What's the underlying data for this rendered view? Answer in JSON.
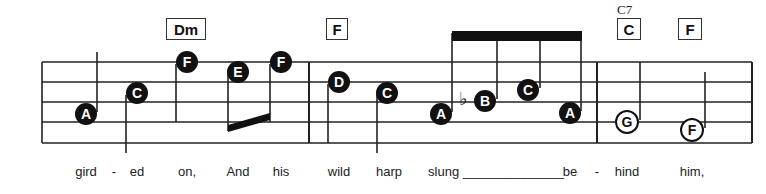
{
  "chords": [
    {
      "label": "Dm",
      "x": 166,
      "w": 38
    },
    {
      "label": "F",
      "x": 326,
      "w": 20
    },
    {
      "label": "C",
      "x": 617,
      "w": 22,
      "sup": "C7"
    },
    {
      "label": "F",
      "x": 678,
      "w": 22
    }
  ],
  "notes": [
    {
      "label": "A",
      "x": 86,
      "y": 114,
      "type": "filled"
    },
    {
      "label": "C",
      "x": 137,
      "y": 93,
      "type": "filled"
    },
    {
      "label": "F",
      "x": 187,
      "y": 62,
      "type": "filled"
    },
    {
      "label": "E",
      "x": 238,
      "y": 72,
      "type": "filled"
    },
    {
      "label": "F",
      "x": 281,
      "y": 62,
      "type": "filled"
    },
    {
      "label": "D",
      "x": 339,
      "y": 82,
      "type": "filled"
    },
    {
      "label": "C",
      "x": 387,
      "y": 93,
      "type": "filled"
    },
    {
      "label": "A",
      "x": 441,
      "y": 114,
      "type": "filled"
    },
    {
      "label": "B",
      "x": 485,
      "y": 101,
      "type": "filled",
      "accidental": "♭"
    },
    {
      "label": "C",
      "x": 528,
      "y": 90,
      "type": "filled"
    },
    {
      "label": "A",
      "x": 570,
      "y": 113,
      "type": "filled"
    },
    {
      "label": "G",
      "x": 627,
      "y": 122,
      "type": "open"
    },
    {
      "label": "F",
      "x": 692,
      "y": 130,
      "type": "open"
    }
  ],
  "lyrics": [
    {
      "text": "gird",
      "x": 86
    },
    {
      "text": "-",
      "x": 114
    },
    {
      "text": "ed",
      "x": 137
    },
    {
      "text": "on,",
      "x": 187
    },
    {
      "text": "And",
      "x": 238
    },
    {
      "text": "his",
      "x": 281
    },
    {
      "text": "wild",
      "x": 339
    },
    {
      "text": "harp",
      "x": 389
    },
    {
      "text": "slung ______________",
      "x": 496
    },
    {
      "text": "be",
      "x": 570
    },
    {
      "text": "-",
      "x": 597
    },
    {
      "text": "hind",
      "x": 627
    },
    {
      "text": "him,",
      "x": 692
    }
  ]
}
